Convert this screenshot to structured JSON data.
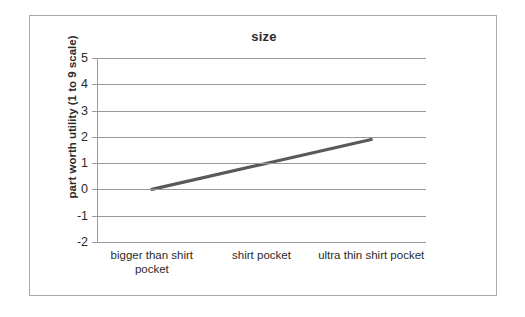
{
  "chart_data": {
    "type": "line",
    "title": "size",
    "xlabel": "",
    "ylabel": "part worth utility (1 to 9 scale)",
    "categories": [
      "bigger than shirt pocket",
      "shirt pocket",
      "ultra thin shirt pocket"
    ],
    "values": [
      0,
      0.95,
      1.9
    ],
    "series": [
      {
        "name": "size",
        "values": [
          0,
          0.95,
          1.9
        ]
      }
    ],
    "ylim": [
      -2,
      5
    ],
    "yticks": [
      5,
      4,
      3,
      2,
      1,
      0,
      -1,
      -2
    ],
    "ytick_labels": [
      "5",
      "4",
      "3",
      "2",
      "1",
      "0",
      "-1",
      "-2"
    ],
    "grid": true,
    "legend": false,
    "line_color": "#595959",
    "grid_color": "#9a9a9a",
    "border_color": "#a9a9a9",
    "background": "#ffffff"
  }
}
